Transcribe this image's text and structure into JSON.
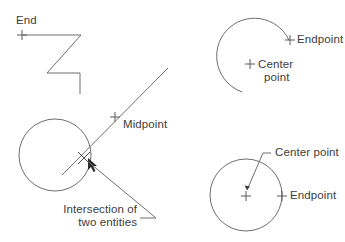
{
  "diagram": {
    "background_color": "#ffffff",
    "stroke_color": "#6e6e6e",
    "text_color": "#3c3c3c",
    "labels": {
      "end": "End",
      "midpoint": "Midpoint",
      "intersection_line1": "Intersection of",
      "intersection_line2": "two entities",
      "arc_endpoint": "Endpoint",
      "arc_center_line1": "Center",
      "arc_center_line2": "point",
      "circle_center": "Center point",
      "circle_endpoint": "Endpoint"
    },
    "markers": {
      "end_plus": "plus-marker",
      "midpoint_plus": "plus-marker",
      "intersection_cross": "x-cross-marker",
      "cursor": "arrow-cursor",
      "arc_endpoint_plus": "plus-marker",
      "arc_center_plus": "plus-marker",
      "circle_center_plus": "plus-marker",
      "circle_endpoint_plus": "plus-marker"
    },
    "shapes": {
      "polyline": "z-shaped-polyline",
      "arc": "open-arc",
      "circle_left": "circle",
      "circle_right": "circle",
      "diagonal_line": "line",
      "leader_intersection": "leader-line",
      "leader_center": "leader-line"
    }
  }
}
